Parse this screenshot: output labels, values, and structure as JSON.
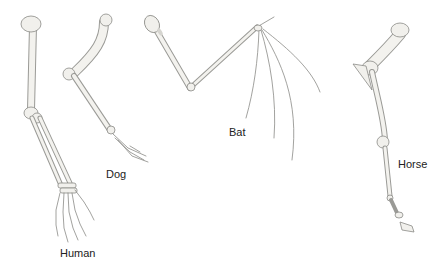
{
  "figure": {
    "limbs": [
      {
        "id": "human",
        "label": "Human"
      },
      {
        "id": "dog",
        "label": "Dog"
      },
      {
        "id": "bat",
        "label": "Bat"
      },
      {
        "id": "horse",
        "label": "Horse"
      }
    ]
  },
  "colors": {
    "background": "#ffffff",
    "bone_fill": "#f1f0ec",
    "bone_outline": "#8a8a86",
    "label_text": "#222222"
  }
}
